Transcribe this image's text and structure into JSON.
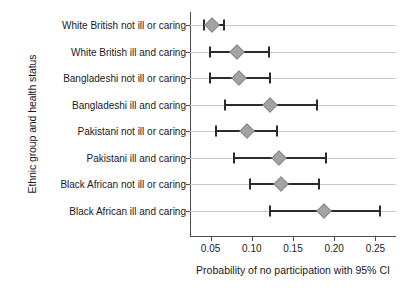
{
  "chart_data": {
    "type": "scatter",
    "title": "",
    "xlabel": "Probability of no participation with 95% CI",
    "ylabel": "Ethnic group and health status",
    "xlim": [
      0.025,
      0.275
    ],
    "xticks": [
      0.05,
      0.1,
      0.15,
      0.2,
      0.25
    ],
    "xticklabels": [
      "0.05",
      "0.10",
      "0.15",
      "0.20",
      "0.25"
    ],
    "grid": true,
    "legend": "none",
    "orientation": "horizontal",
    "categories": [
      "White British not ill or caring",
      "White British ill and caring",
      "Bangladeshi not ill or caring",
      "Bangladeshi ill and caring",
      "Pakistani not ill or caring",
      "Pakistani ill and caring",
      "Black African not ill or caring",
      "Black African ill and caring"
    ],
    "points": [
      {
        "category": "White British not ill or caring",
        "estimate": 0.052,
        "ci_low": 0.042,
        "ci_high": 0.066
      },
      {
        "category": "White British ill and caring",
        "estimate": 0.082,
        "ci_low": 0.049,
        "ci_high": 0.121
      },
      {
        "category": "Bangladeshi not ill or caring",
        "estimate": 0.085,
        "ci_low": 0.049,
        "ci_high": 0.122
      },
      {
        "category": "Bangladeshi ill and caring",
        "estimate": 0.122,
        "ci_low": 0.068,
        "ci_high": 0.179
      },
      {
        "category": "Pakistani not ill or caring",
        "estimate": 0.094,
        "ci_low": 0.057,
        "ci_high": 0.13
      },
      {
        "category": "Pakistani ill and caring",
        "estimate": 0.133,
        "ci_low": 0.079,
        "ci_high": 0.19
      },
      {
        "category": "Black African not ill or caring",
        "estimate": 0.136,
        "ci_low": 0.098,
        "ci_high": 0.181
      },
      {
        "category": "Black African ill and caring",
        "estimate": 0.188,
        "ci_low": 0.122,
        "ci_high": 0.256
      }
    ],
    "colors": {
      "marker_fill": "#a3a3a3",
      "marker_edge": "#8a8a8a",
      "ci_line": "#2b2b2b",
      "gridline": "#c9c9c9",
      "axis": "#4d4d4d",
      "text": "#1a1a1a",
      "background": "#ffffff"
    }
  }
}
